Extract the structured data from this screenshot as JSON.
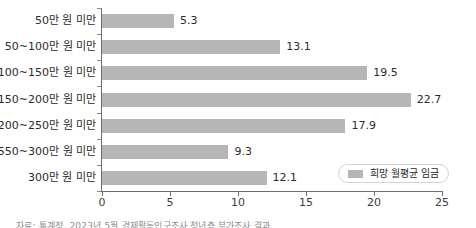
{
  "chart_data": {
    "type": "bar",
    "orientation": "horizontal",
    "title": "",
    "xlabel": "",
    "ylabel": "",
    "categories": [
      "50만 원 미만",
      "50~100만 원 미만",
      "100~150만 원 미만",
      "150~200만 원 미만",
      "200~250만 원 미만",
      "550~300만 원 미만",
      "300만 원 미만"
    ],
    "values": [
      5.3,
      13.1,
      19.5,
      22.7,
      17.9,
      9.3,
      12.1
    ],
    "value_labels": [
      "5.3",
      "13.1",
      "19.5",
      "22.7",
      "17.9",
      "9.3",
      "12.1"
    ],
    "series": [
      {
        "name": "희망 월평균 임금",
        "values": [
          5.3,
          13.1,
          19.5,
          22.7,
          17.9,
          9.3,
          12.1
        ]
      }
    ],
    "xlim": [
      0,
      25
    ],
    "xticks": [
      0,
      5,
      10,
      15,
      20,
      25
    ],
    "xtick_labels": [
      "0",
      "5",
      "10",
      "15",
      "20",
      "25"
    ],
    "grid": false,
    "legend_position": "bottom-right",
    "bar_color": "#b6b6b6",
    "axis_color": "#6e6e6e"
  },
  "legend": {
    "label": "희망 월평균 임금"
  },
  "caption": {
    "text": "자료: 통계청, 2023년 5월 경제활동인구조사 청년층 부가조사 결과"
  }
}
